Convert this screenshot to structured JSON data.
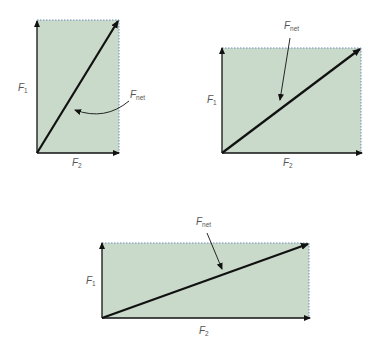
{
  "colors": {
    "fill": "#c9dacb",
    "dotted_edge": "#6f8fb8",
    "vector": "#111111",
    "label": "#555555"
  },
  "diagrams": [
    {
      "id": "tall",
      "rect": {
        "x": 37,
        "y": 20,
        "w": 82,
        "h": 133
      },
      "labels": {
        "f1": {
          "main": "F",
          "sub": "1",
          "x": 18,
          "y": 91
        },
        "f2": {
          "main": "F",
          "sub": "2",
          "x": 72,
          "y": 166
        },
        "fnet": {
          "main": "F",
          "sub": "net",
          "x": 130,
          "y": 98
        }
      },
      "pointer": "curved"
    },
    {
      "id": "wide",
      "rect": {
        "x": 222,
        "y": 48,
        "w": 139,
        "h": 105
      },
      "labels": {
        "f1": {
          "main": "F",
          "sub": "1",
          "x": 207,
          "y": 103
        },
        "f2": {
          "main": "F",
          "sub": "2",
          "x": 283,
          "y": 166
        },
        "fnet": {
          "main": "F",
          "sub": "net",
          "x": 284,
          "y": 29
        }
      },
      "pointer": "straight"
    },
    {
      "id": "long",
      "rect": {
        "x": 102,
        "y": 243,
        "w": 207,
        "h": 75
      },
      "labels": {
        "f1": {
          "main": "F",
          "sub": "1",
          "x": 86,
          "y": 284
        },
        "f2": {
          "main": "F",
          "sub": "2",
          "x": 199,
          "y": 334
        },
        "fnet": {
          "main": "F",
          "sub": "net",
          "x": 196,
          "y": 225
        }
      },
      "pointer": "straight"
    }
  ],
  "text": {
    "F": "F",
    "sub1": "1",
    "sub2": "2",
    "subnet": "net"
  }
}
